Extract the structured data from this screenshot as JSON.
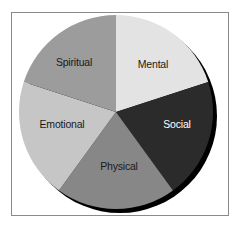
{
  "chart_data": {
    "type": "pie",
    "title": "",
    "categories": [
      "Mental",
      "Social",
      "Physical",
      "Emotional",
      "Spiritual"
    ],
    "values": [
      20,
      20,
      20,
      20,
      20
    ],
    "colors": [
      "#e3e3e3",
      "#2b2b2b",
      "#878787",
      "#c6c6c6",
      "#9c9c9c"
    ],
    "label_colors": [
      "#1a1a1a",
      "#ffffff",
      "#1a1a1a",
      "#1a1a1a",
      "#1a1a1a"
    ],
    "start_angle_deg": -90,
    "direction": "clockwise",
    "shadow": true,
    "legend": "none",
    "labels_inside": true
  },
  "labels": {
    "mental": "Mental",
    "social": "Social",
    "physical": "Physical",
    "emotional": "Emotional",
    "spiritual": "Spiritual"
  }
}
